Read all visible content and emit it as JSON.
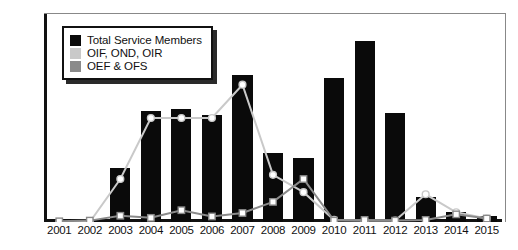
{
  "chart_data": {
    "type": "bar",
    "title": "",
    "xlabel": "",
    "ylabel": "",
    "ylim": [
      0,
      300
    ],
    "yticks": [
      0,
      50,
      100,
      150,
      200,
      250,
      300
    ],
    "grid": false,
    "legend_position": "top-left",
    "categories": [
      "2001",
      "2002",
      "2003",
      "2004",
      "2005",
      "2006",
      "2007",
      "2008",
      "2009",
      "2010",
      "2011",
      "2012",
      "2013",
      "2014",
      "2015"
    ],
    "series": [
      {
        "name": "Total Service Members",
        "type": "bar",
        "color": "#0a0a0a",
        "values": [
          0,
          0,
          78,
          160,
          163,
          155,
          212,
          100,
          92,
          208,
          261,
          157,
          36,
          15,
          8
        ]
      },
      {
        "name": "OIF, OND, OIR",
        "type": "line",
        "color": "#c9c9c9",
        "marker": "circle",
        "values": [
          0,
          0,
          62,
          150,
          150,
          150,
          198,
          68,
          43,
          3,
          2,
          2,
          40,
          14,
          5
        ]
      },
      {
        "name": "OEF & OFS",
        "type": "line",
        "color": "#8a8a8a",
        "marker": "square",
        "values": [
          1,
          2,
          9,
          6,
          17,
          8,
          13,
          29,
          62,
          2,
          3,
          2,
          3,
          11,
          5
        ]
      }
    ]
  },
  "legend": {
    "items": [
      {
        "label": "Total Service Members",
        "color": "#0a0a0a"
      },
      {
        "label": "OIF, OND, OIR",
        "color": "#c9c9c9"
      },
      {
        "label": "OEF & OFS",
        "color": "#8a8a8a"
      }
    ]
  }
}
